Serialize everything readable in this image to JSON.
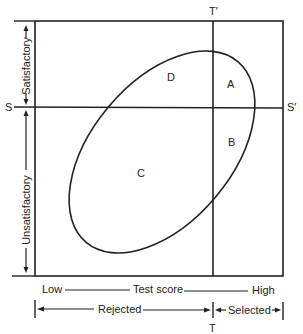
{
  "diagram": {
    "y_axis": {
      "upper_label": "Satisfactory",
      "lower_label": "Unsatisfactory"
    },
    "x_axis": {
      "low_label": "Low",
      "title": "Test score",
      "high_label": "High"
    },
    "decision": {
      "rejected_label": "Rejected",
      "selected_label": "Selected"
    },
    "cutoff_lines": {
      "criterion_left": "S",
      "criterion_right": "S′",
      "test_top": "T′",
      "test_bottom": "T"
    },
    "quadrants": {
      "A": "A",
      "B": "B",
      "C": "C",
      "D": "D"
    },
    "colors": {
      "line": "#222222",
      "background": "#ffffff"
    }
  }
}
